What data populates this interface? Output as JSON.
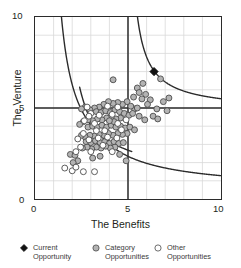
{
  "chart_data": {
    "type": "scatter",
    "title": "",
    "xlabel": "The Benefits",
    "ylabel": "The Venture",
    "xlim": [
      0,
      10
    ],
    "ylim": [
      0,
      10
    ],
    "xticks": [
      0,
      5,
      10
    ],
    "yticks": [
      0,
      5,
      10
    ],
    "xtick_labels": [
      "0",
      "5",
      "10"
    ],
    "ytick_labels": [
      "0",
      "5",
      "10"
    ],
    "grid": true,
    "grid_step": 1,
    "grid_color": "#d8d8d8",
    "frame_color": "#2b2b2b",
    "legend_position": "below",
    "reference_lines": [
      {
        "name": "midline-vertical",
        "orientation": "vertical",
        "value": 5,
        "color": "#2b2b2b"
      },
      {
        "name": "midline-horizontal",
        "orientation": "horizontal",
        "value": 5,
        "color": "#2b2b2b"
      }
    ],
    "reference_curves": [
      {
        "name": "upper-right-hyperbola",
        "equation": "(x-4.85)*(y-4.85) = 3.4",
        "branch": "upper-right",
        "color": "#2b2b2b"
      },
      {
        "name": "upper-left-hyperbola",
        "equation": "(x-0.6)*(y-1.0) = 7.4",
        "branch": "upper-left",
        "color": "#2b2b2b"
      },
      {
        "name": "lower-right-hyperbola",
        "equation": "(x-1.1)*(y-0.45) = 7.4",
        "branch": "lower-right",
        "color": "#2b2b2b"
      }
    ],
    "series": [
      {
        "name": "Current Opportunity",
        "marker": "diamond",
        "fill": "#111111",
        "edge": "#111111",
        "points": [
          [
            6.4,
            7.0
          ]
        ]
      },
      {
        "name": "Category Opportunities",
        "marker": "circle",
        "fill": "#b3b3b3",
        "edge": "#4a4a4a",
        "points": [
          [
            4.2,
            6.55
          ],
          [
            5.5,
            6.1
          ],
          [
            5.6,
            5.85
          ],
          [
            5.95,
            5.75
          ],
          [
            5.3,
            5.6
          ],
          [
            5.75,
            5.5
          ],
          [
            6.2,
            5.45
          ],
          [
            6.9,
            5.35
          ],
          [
            7.2,
            5.55
          ],
          [
            6.05,
            5.2
          ],
          [
            6.55,
            4.95
          ],
          [
            7.1,
            4.85
          ],
          [
            6.35,
            4.55
          ],
          [
            6.6,
            4.4
          ],
          [
            5.9,
            4.35
          ],
          [
            5.6,
            4.55
          ],
          [
            5.35,
            4.95
          ],
          [
            5.15,
            5.1
          ],
          [
            4.95,
            5.35
          ],
          [
            4.7,
            5.2
          ],
          [
            4.45,
            5.3
          ],
          [
            4.2,
            5.25
          ],
          [
            3.95,
            5.35
          ],
          [
            3.7,
            5.2
          ],
          [
            3.45,
            5.05
          ],
          [
            3.2,
            5.0
          ],
          [
            2.95,
            4.9
          ],
          [
            2.7,
            5.05
          ],
          [
            2.5,
            4.95
          ],
          [
            3.3,
            4.8
          ],
          [
            3.55,
            4.75
          ],
          [
            3.8,
            4.85
          ],
          [
            4.05,
            4.75
          ],
          [
            4.3,
            4.9
          ],
          [
            4.55,
            4.8
          ],
          [
            4.8,
            4.7
          ],
          [
            5.05,
            4.6
          ],
          [
            5.25,
            4.7
          ],
          [
            4.6,
            4.45
          ],
          [
            4.35,
            4.4
          ],
          [
            4.1,
            4.5
          ],
          [
            3.85,
            4.45
          ],
          [
            3.6,
            4.35
          ],
          [
            3.35,
            4.4
          ],
          [
            3.1,
            4.3
          ],
          [
            2.85,
            4.35
          ],
          [
            2.6,
            4.25
          ],
          [
            2.4,
            4.1
          ],
          [
            2.85,
            3.95
          ],
          [
            3.1,
            4.0
          ],
          [
            3.35,
            3.95
          ],
          [
            3.6,
            4.05
          ],
          [
            3.85,
            3.95
          ],
          [
            4.1,
            4.05
          ],
          [
            4.35,
            3.95
          ],
          [
            4.6,
            4.0
          ],
          [
            4.85,
            3.9
          ],
          [
            5.1,
            3.95
          ],
          [
            5.35,
            3.8
          ],
          [
            4.95,
            3.6
          ],
          [
            4.7,
            3.55
          ],
          [
            4.45,
            3.6
          ],
          [
            4.2,
            3.5
          ],
          [
            3.95,
            3.6
          ],
          [
            3.7,
            3.5
          ],
          [
            3.45,
            3.55
          ],
          [
            3.2,
            3.45
          ],
          [
            2.95,
            3.5
          ],
          [
            2.7,
            3.4
          ],
          [
            2.5,
            3.5
          ],
          [
            2.75,
            3.15
          ],
          [
            3.0,
            3.1
          ],
          [
            3.25,
            3.2
          ],
          [
            3.5,
            3.1
          ],
          [
            3.75,
            3.15
          ],
          [
            4.0,
            3.05
          ],
          [
            4.25,
            3.15
          ],
          [
            4.5,
            3.05
          ],
          [
            4.75,
            3.1
          ],
          [
            4.3,
            2.85
          ],
          [
            4.05,
            2.8
          ],
          [
            3.8,
            2.9
          ],
          [
            3.55,
            2.8
          ],
          [
            3.3,
            2.85
          ],
          [
            3.05,
            2.75
          ],
          [
            2.8,
            2.85
          ],
          [
            2.55,
            2.8
          ],
          [
            1.9,
            2.45
          ],
          [
            2.15,
            2.4
          ],
          [
            2.3,
            2.1
          ],
          [
            2.05,
            2.0
          ],
          [
            3.1,
            2.25
          ],
          [
            3.5,
            2.35
          ],
          [
            4.55,
            2.45
          ],
          [
            4.9,
            2.1
          ],
          [
            4.25,
            4.25
          ],
          [
            4.0,
            4.3
          ],
          [
            5.5,
            5.0
          ],
          [
            5.8,
            6.35
          ],
          [
            6.75,
            6.6
          ]
        ]
      },
      {
        "name": "Other Opportunities",
        "marker": "circle",
        "fill": "#ffffff",
        "edge": "#4a4a4a",
        "points": [
          [
            2.8,
            5.05
          ],
          [
            3.0,
            4.7
          ],
          [
            2.65,
            4.3
          ],
          [
            3.9,
            5.1
          ],
          [
            4.45,
            5.05
          ],
          [
            3.45,
            4.6
          ],
          [
            4.15,
            4.65
          ],
          [
            3.2,
            4.15
          ],
          [
            2.6,
            3.6
          ],
          [
            2.9,
            3.25
          ],
          [
            3.4,
            3.35
          ],
          [
            3.9,
            3.4
          ],
          [
            4.4,
            3.35
          ],
          [
            3.65,
            2.95
          ],
          [
            4.15,
            2.6
          ],
          [
            3.0,
            2.6
          ],
          [
            2.45,
            2.85
          ],
          [
            2.3,
            3.3
          ],
          [
            2.2,
            2.6
          ],
          [
            1.6,
            1.7
          ],
          [
            2.0,
            1.55
          ],
          [
            2.2,
            1.75
          ],
          [
            2.6,
            1.5
          ],
          [
            3.2,
            1.5
          ],
          [
            4.45,
            4.15
          ],
          [
            4.65,
            3.8
          ],
          [
            3.75,
            3.75
          ],
          [
            3.3,
            3.75
          ],
          [
            2.9,
            4.55
          ],
          [
            4.9,
            4.35
          ]
        ]
      }
    ]
  },
  "legend": {
    "items": [
      {
        "name": "current-opportunity",
        "line1": "Current",
        "line2": "Opportunity",
        "marker": "diamond",
        "fill": "#111111"
      },
      {
        "name": "category-opportunities",
        "line1": "Category",
        "line2": "Opportunities",
        "marker": "circle",
        "fill": "#b3b3b3"
      },
      {
        "name": "other-opportunities",
        "line1": "Other",
        "line2": "Opportunities",
        "marker": "circle",
        "fill": "#ffffff"
      }
    ]
  }
}
